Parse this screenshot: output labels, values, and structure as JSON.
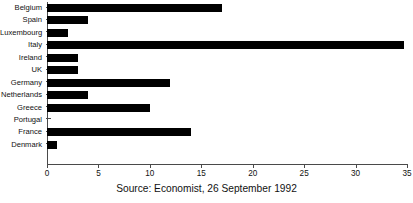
{
  "chart_data": {
    "type": "bar",
    "orientation": "horizontal",
    "title": "",
    "xlabel": "",
    "ylabel": "",
    "xlim": [
      0,
      35
    ],
    "xticks": [
      0,
      5,
      10,
      15,
      20,
      25,
      30,
      35
    ],
    "grid": false,
    "legend": null,
    "bar_color": "#000000",
    "axis_color": "#4a4a4a",
    "categories": [
      "Belgium",
      "Spain",
      "Luxembourg",
      "Italy",
      "Ireland",
      "UK",
      "Germany",
      "Netherlands",
      "Greece",
      "Portugal",
      "France",
      "Denmark"
    ],
    "values": [
      17,
      4,
      2,
      34.7,
      3,
      3,
      12,
      4,
      10,
      0,
      14,
      1
    ]
  },
  "caption": "Source: Economist, 26 September 1992"
}
